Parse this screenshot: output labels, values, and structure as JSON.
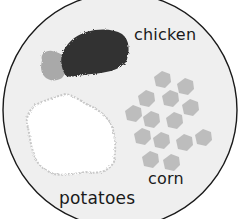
{
  "plate": {
    "description": "plate of food",
    "fill": "#efefef",
    "stroke": "#1a1a1a"
  },
  "foods": [
    {
      "id": "chicken",
      "label": "chicken",
      "color": "#333333",
      "bone_color": "#a9a9a9"
    },
    {
      "id": "potatoes",
      "label": "potatoes",
      "color": "#ffffff",
      "edge_color": "#c8c8c8"
    },
    {
      "id": "corn",
      "label": "corn",
      "color": "#bdbdbd",
      "kernel_count": 14
    }
  ],
  "labels": {
    "chicken": "chicken",
    "potatoes": "potatoes",
    "corn": "corn"
  }
}
